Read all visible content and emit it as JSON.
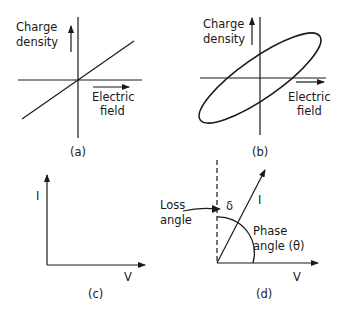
{
  "panels": {
    "a": {
      "caption": "(a)",
      "y_label_line1": "Charge",
      "y_label_line2": "density",
      "x_label_line1": "Electric",
      "x_label_line2": "field",
      "description": "linear relation through origin"
    },
    "b": {
      "caption": "(b)",
      "y_label_line1": "Charge",
      "y_label_line2": "density",
      "x_label_line1": "Electric",
      "x_label_line2": "field",
      "description": "hysteresis loop (tilted ellipse)"
    },
    "c": {
      "caption": "(c)",
      "y_label": "I",
      "x_label": "V"
    },
    "d": {
      "caption": "(d)",
      "current_label": "I",
      "voltage_label": "V",
      "loss_label_line1": "Loss",
      "loss_label_line2": "angle",
      "delta_symbol": "δ",
      "phase_label_line1": "Phase",
      "phase_label_line2": "angle (θ)"
    }
  }
}
